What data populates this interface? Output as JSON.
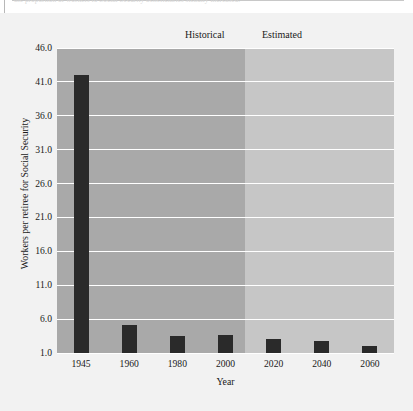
{
  "caption": {
    "text": "the proportion of workers to Social Security beneficiaries steadily increased."
  },
  "chart_data": {
    "type": "bar",
    "title": "",
    "subtitle": "",
    "xlabel": "Year",
    "ylabel": "Workers per retiree for Social Security",
    "categories": [
      "1945",
      "1960",
      "1980",
      "2000",
      "2020",
      "2040",
      "2060"
    ],
    "values": [
      42.0,
      5.2,
      3.5,
      3.6,
      3.0,
      2.8,
      2.0
    ],
    "series": [
      {
        "name": "Workers per retiree for Social Security",
        "values": [
          42.0,
          5.2,
          3.5,
          3.6,
          3.0,
          2.8,
          2.0
        ]
      }
    ],
    "ylim": [
      1.0,
      46.0
    ],
    "ytick_labels": [
      "46.0",
      "41.0",
      "36.0",
      "31.0",
      "26.0",
      "21.0",
      "16.0",
      "11.0",
      "6.0",
      "1.0"
    ],
    "ytick_values": [
      46.0,
      41.0,
      36.0,
      31.0,
      26.0,
      21.0,
      16.0,
      11.0,
      6.0,
      1.0
    ],
    "grid": true,
    "grid_color": "#ffffff",
    "bar_color": "#2a2a2a",
    "legend_position": "inside-top",
    "regions": [
      {
        "label": "Historical",
        "categories": [
          "1945",
          "1960",
          "1980",
          "2000"
        ],
        "color": "#a9a9a9"
      },
      {
        "label": "Estimated",
        "categories": [
          "2020",
          "2040",
          "2060"
        ],
        "color": "#c6c6c6"
      }
    ],
    "background_color": "#f2f2f2"
  }
}
